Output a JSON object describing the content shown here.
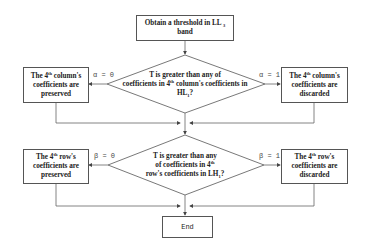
{
  "flowchart": {
    "start": {
      "text": "Obtain a threshold in LL",
      "sub": "3",
      "text2": "band"
    },
    "decision1": {
      "line1": "T is greater than any of",
      "line2a": "coefficients in 4",
      "line2sup": "th",
      "line2b": " column's coefficients in",
      "line3a": "HL",
      "line3sub": "1",
      "line3b": "?"
    },
    "alpha0": {
      "label": "α = 0"
    },
    "alpha1": {
      "label": "α = 1"
    },
    "col_preserved": {
      "pre": "The 4",
      "sup": "th",
      "post": " column's",
      "line2": "coefficients are",
      "line3": "preserved"
    },
    "col_discarded": {
      "pre": "The 4",
      "sup": "th",
      "post": " column's",
      "line2": "coefficients are",
      "line3": "discarded"
    },
    "decision2": {
      "line1": "T is greater than any",
      "line2a": "of coefficients in 4",
      "line2sup": "th",
      "line3a": "row's coefficients in LH",
      "line3sub": "1",
      "line3b": "?"
    },
    "beta0": {
      "label": "β = 0"
    },
    "beta1": {
      "label": "β = 1"
    },
    "row_preserved": {
      "pre": "The 4",
      "sup": "th",
      "post": " row's",
      "line2": "coefficients are",
      "line3": "preserved"
    },
    "row_discarded": {
      "pre": "The 4",
      "sup": "th",
      "post": " row's",
      "line2": "coefficients are",
      "line3": "discarded"
    },
    "end": {
      "text": "End"
    }
  },
  "colors": {
    "stroke": "#555555",
    "text": "#222222",
    "background": "#ffffff"
  }
}
